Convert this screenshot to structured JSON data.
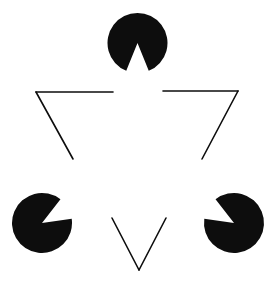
{
  "figure": {
    "name": "Kanizsa Triangle",
    "canvas": {
      "width": 278,
      "height": 283
    },
    "background_color": "#ffffff",
    "ink_color": "#0d0d0d",
    "stroke_width": 1.6
  },
  "chart_data": {
    "type": "diagram",
    "inducers": [
      {
        "name": "top-pacman",
        "cx": 137.5,
        "cy": 43,
        "r": 30,
        "wedge_start_deg": 68,
        "wedge_end_deg": 112,
        "opening_direction": "down",
        "fill": "#0d0d0d"
      },
      {
        "name": "bottom-left-pacman",
        "cx": 42,
        "cy": 223,
        "r": 30,
        "wedge_start_deg": -52,
        "wedge_end_deg": -8,
        "opening_direction": "upper-right",
        "fill": "#0d0d0d"
      },
      {
        "name": "bottom-right-pacman",
        "cx": 234,
        "cy": 223,
        "r": 30,
        "wedge_start_deg": 188,
        "wedge_end_deg": 232,
        "opening_direction": "upper-left",
        "fill": "#0d0d0d"
      }
    ],
    "outline_triangle": {
      "vertices": [
        {
          "name": "left-vertex",
          "x": 36,
          "y": 92
        },
        {
          "name": "right-vertex",
          "x": 238,
          "y": 91
        },
        {
          "name": "bottom-vertex",
          "x": 139,
          "y": 270
        }
      ],
      "segments": [
        {
          "name": "top-left-segment",
          "x1": 36,
          "y1": 92,
          "x2": 113,
          "y2": 92
        },
        {
          "name": "top-right-segment",
          "x1": 163,
          "y1": 91,
          "x2": 238,
          "y2": 91
        },
        {
          "name": "left-lower-segment",
          "x1": 36,
          "y1": 92,
          "x2": 73,
          "y2": 159
        },
        {
          "name": "right-lower-segment",
          "x1": 238,
          "y1": 91,
          "x2": 202,
          "y2": 159
        },
        {
          "name": "bottom-left-segment",
          "x1": 112,
          "y1": 218,
          "x2": 139,
          "y2": 270
        },
        {
          "name": "bottom-right-segment",
          "x1": 166,
          "y1": 218,
          "x2": 139,
          "y2": 270
        }
      ],
      "stroke": "#0d0d0d",
      "stroke_width": 1.6,
      "fill": "none"
    }
  }
}
